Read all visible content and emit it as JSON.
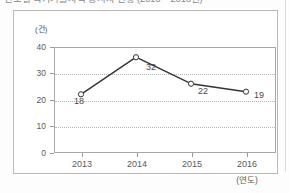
{
  "heading": {
    "text": "연도별 국가기술자격 응시자 현황 (2013 ~ 2016년)",
    "note_clipped": "clipped-at-top-edge"
  },
  "figure": {
    "y_unit_label": "(건)",
    "x_unit_label": "(연도)"
  },
  "chart_data": {
    "type": "line",
    "title": "",
    "xlabel": "(연도)",
    "ylabel": "(건)",
    "categories": [
      "2013",
      "2014",
      "2015",
      "2016"
    ],
    "values": [
      18,
      32,
      22,
      19
    ],
    "series": [
      {
        "name": "건수",
        "values": [
          18,
          32,
          22,
          19
        ]
      }
    ],
    "point_labels": [
      "18",
      "32",
      "22",
      "19"
    ],
    "y_ticks": [
      "0",
      "10",
      "20",
      "30",
      "40"
    ],
    "ylim": [
      0,
      40
    ],
    "grid": "horizontal-dotted",
    "legend": "none",
    "marker": "open-circle",
    "line_color": "#333333",
    "grid_color": "#b5b5b5",
    "frame_color": "#a8a8a8"
  }
}
